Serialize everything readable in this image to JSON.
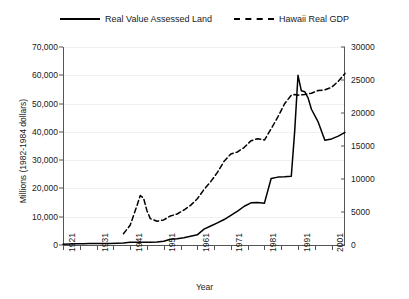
{
  "legend": {
    "items": [
      {
        "label": "Real Value Assessed Land",
        "style": "solid",
        "color": "#000000"
      },
      {
        "label": "Hawaii Real GDP",
        "style": "dashed",
        "color": "#000000"
      }
    ]
  },
  "axes": {
    "y_left_label": "Millions (1982-1984 dollars)",
    "y_left_ticks": [
      "0",
      "10,000",
      "20,000",
      "30,000",
      "40,000",
      "50,000",
      "60,000",
      "70,000"
    ],
    "y_right_ticks": [
      "0",
      "5000",
      "10000",
      "15000",
      "20000",
      "25000",
      "30000"
    ],
    "x_label": "Year",
    "x_ticks": [
      "1921",
      "1931",
      "1941",
      "1951",
      "1961",
      "1971",
      "1981",
      "1991",
      "2001"
    ]
  },
  "chart_data": {
    "type": "line",
    "title": "",
    "xlabel": "Year",
    "ylabel": "Millions (1982-1984 dollars)",
    "y2label": "",
    "xlim": [
      1921,
      2005
    ],
    "ylim": [
      0,
      70000
    ],
    "y2lim": [
      0,
      30000
    ],
    "grid": true,
    "legend_position": "top-center",
    "xticks": [
      1921,
      1931,
      1941,
      1951,
      1961,
      1971,
      1981,
      1991,
      2001
    ],
    "yticks": [
      0,
      10000,
      20000,
      30000,
      40000,
      50000,
      60000,
      70000
    ],
    "y2ticks": [
      0,
      5000,
      10000,
      15000,
      20000,
      25000,
      30000
    ],
    "series": [
      {
        "name": "Real Value Assessed Land",
        "axis": "left",
        "style": "solid",
        "color": "#000000",
        "x": [
          1921,
          1923,
          1925,
          1927,
          1929,
          1931,
          1933,
          1935,
          1937,
          1939,
          1941,
          1943,
          1945,
          1947,
          1949,
          1951,
          1953,
          1955,
          1957,
          1959,
          1961,
          1963,
          1965,
          1967,
          1969,
          1971,
          1973,
          1975,
          1977,
          1979,
          1981,
          1983,
          1985,
          1987,
          1989,
          1990,
          1991,
          1992,
          1993,
          1994,
          1995,
          1997,
          1999,
          2001,
          2003,
          2005
        ],
        "y": [
          300,
          350,
          400,
          450,
          500,
          520,
          520,
          550,
          600,
          700,
          1000,
          1000,
          950,
          1000,
          1050,
          1300,
          2000,
          2200,
          2600,
          3100,
          3600,
          5600,
          6700,
          7800,
          9000,
          10500,
          12000,
          13700,
          14900,
          15000,
          14800,
          23500,
          24000,
          24100,
          24300,
          40000,
          60000,
          54500,
          54200,
          52000,
          48000,
          43500,
          37000,
          37500,
          38500,
          39800
        ]
      },
      {
        "name": "Hawaii Real GDP",
        "axis": "right",
        "style": "dashed",
        "color": "#000000",
        "x": [
          1939,
          1941,
          1943,
          1944,
          1945,
          1946,
          1947,
          1949,
          1951,
          1953,
          1955,
          1957,
          1959,
          1961,
          1963,
          1965,
          1967,
          1969,
          1971,
          1973,
          1975,
          1977,
          1979,
          1981,
          1983,
          1985,
          1987,
          1989,
          1990,
          1991,
          1993,
          1995,
          1997,
          1999,
          2001,
          2003,
          2005
        ],
        "y": [
          1700,
          3000,
          5900,
          7500,
          7100,
          5200,
          4000,
          3600,
          3800,
          4400,
          4700,
          5300,
          6000,
          7000,
          8400,
          9600,
          11000,
          12700,
          13800,
          14100,
          14800,
          15800,
          16100,
          15900,
          17600,
          19400,
          21400,
          22700,
          22800,
          22700,
          22800,
          23000,
          23400,
          23500,
          23900,
          24800,
          26000
        ]
      }
    ]
  }
}
